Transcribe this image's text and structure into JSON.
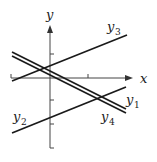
{
  "figure": {
    "axes": {
      "x_label": "x",
      "y_label": "y"
    },
    "lines": [
      {
        "id": "y1",
        "name": "y",
        "sub": "1",
        "style": "double",
        "slope": "negative",
        "color": "#1a1a1a"
      },
      {
        "id": "y2",
        "name": "y",
        "sub": "2",
        "style": "single",
        "slope": "positive",
        "color": "#1a1a1a"
      },
      {
        "id": "y3",
        "name": "y",
        "sub": "3",
        "style": "single",
        "slope": "positive",
        "color": "#1a1a1a"
      },
      {
        "id": "y4",
        "name": "y",
        "sub": "4",
        "style": "single",
        "slope": "negative",
        "color": "#1a1a1a"
      }
    ],
    "labels": {
      "y1_main": "y",
      "y1_sub": "1",
      "y2_main": "y",
      "y2_sub": "2",
      "y3_main": "y",
      "y3_sub": "3",
      "y4_main": "y",
      "y4_sub": "4"
    }
  }
}
